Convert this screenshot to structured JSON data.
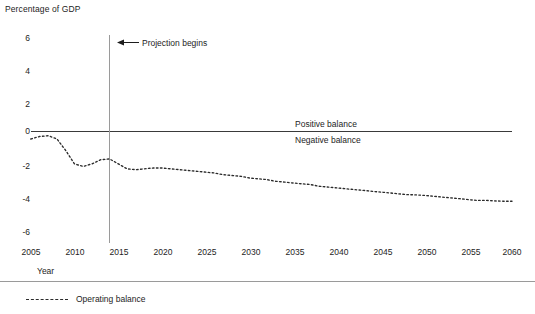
{
  "axis": {
    "y_title": "Percentage of GDP",
    "x_title": "Year",
    "y_ticks": [
      "6",
      "4",
      "2",
      "0",
      "-2",
      "-4",
      "-6"
    ],
    "x_ticks": [
      "2005",
      "2010",
      "2015",
      "2020",
      "2025",
      "2030",
      "2035",
      "2040",
      "2045",
      "2050",
      "2055",
      "2060"
    ]
  },
  "annotations": {
    "projection": "Projection begins",
    "positive": "Positive balance",
    "negative": "Negative balance"
  },
  "legend": {
    "series_label": "Operating balance"
  },
  "colors": {
    "line": "#2b2b2b",
    "axis": "#3a3a3a",
    "projection_rule": "#8e8e8e",
    "text": "#1d1d1d"
  },
  "chart_data": {
    "type": "line",
    "title": "",
    "xlabel": "Year",
    "ylabel": "Percentage of GDP",
    "xlim": [
      2005,
      2060
    ],
    "ylim": [
      -6,
      6
    ],
    "ytick_values": [
      6,
      4,
      2,
      0,
      -2,
      -4,
      -6
    ],
    "xtick_values": [
      2005,
      2010,
      2015,
      2020,
      2025,
      2030,
      2035,
      2040,
      2045,
      2050,
      2055,
      2060
    ],
    "grid": false,
    "legend_position": "below-axes-left",
    "zero_reference_line": 0,
    "projection_start_year": 2014,
    "series": [
      {
        "name": "Operating balance",
        "style": "dotted",
        "x": [
          2005,
          2006,
          2007,
          2008,
          2009,
          2010,
          2011,
          2012,
          2013,
          2014,
          2015,
          2016,
          2017,
          2018,
          2019,
          2020,
          2021,
          2022,
          2023,
          2024,
          2025,
          2026,
          2027,
          2028,
          2029,
          2030,
          2031,
          2032,
          2033,
          2034,
          2035,
          2036,
          2037,
          2038,
          2039,
          2040,
          2041,
          2042,
          2043,
          2044,
          2045,
          2046,
          2047,
          2048,
          2049,
          2050,
          2051,
          2052,
          2053,
          2054,
          2055,
          2056,
          2057,
          2058,
          2059,
          2060
        ],
        "values": [
          -0.45,
          -0.3,
          -0.25,
          -0.45,
          -1.15,
          -1.95,
          -2.1,
          -1.95,
          -1.7,
          -1.65,
          -1.95,
          -2.25,
          -2.3,
          -2.25,
          -2.2,
          -2.2,
          -2.25,
          -2.3,
          -2.35,
          -2.4,
          -2.45,
          -2.5,
          -2.6,
          -2.65,
          -2.7,
          -2.8,
          -2.85,
          -2.9,
          -3.0,
          -3.05,
          -3.1,
          -3.15,
          -3.2,
          -3.3,
          -3.35,
          -3.4,
          -3.45,
          -3.5,
          -3.55,
          -3.6,
          -3.65,
          -3.7,
          -3.75,
          -3.8,
          -3.82,
          -3.85,
          -3.9,
          -3.95,
          -4.0,
          -4.05,
          -4.1,
          -4.15,
          -4.15,
          -4.18,
          -4.2,
          -4.2
        ]
      }
    ]
  }
}
